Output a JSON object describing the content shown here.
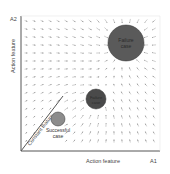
{
  "diagram": {
    "y_axis": {
      "tick_label": "A2",
      "label": "Action feature"
    },
    "x_axis": {
      "tick_label": "A1",
      "label": "Action feature"
    },
    "diagonal_label": "Constant feature",
    "circles": [
      {
        "id": "failure-large",
        "label_lines": [
          "Failure",
          "case"
        ],
        "cx": 126,
        "cy": 43,
        "r": 18,
        "fill": "#5a5a5a",
        "text_color": "#2a2a2a"
      },
      {
        "id": "failure-medium",
        "label_lines": [
          "Failure",
          "case"
        ],
        "cx": 96,
        "cy": 99,
        "r": 10,
        "fill": "#4a4a4a",
        "text_color": "#2a2a2a"
      },
      {
        "id": "successful",
        "label_lines": [
          "Successful",
          "case"
        ],
        "cx": 58,
        "cy": 119,
        "r": 7,
        "fill": "#8c8c8c",
        "text_color": "#333333"
      }
    ],
    "colors": {
      "axis": "#555555",
      "arrow": "#9a9a9a",
      "text": "#444444"
    }
  }
}
